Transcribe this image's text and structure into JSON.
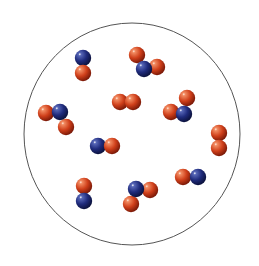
{
  "diagram": {
    "type": "particle-container",
    "container": {
      "cx": 132,
      "cy": 134,
      "rx": 108,
      "ry": 111,
      "stroke": "#555555"
    },
    "atom_radius": 8.2,
    "colors": {
      "nitrogen": {
        "base": "#1f2b7c",
        "light": "#5868b8",
        "dark": "#0a1038"
      },
      "oxygen": {
        "base": "#cf3f1a",
        "light": "#f28c62",
        "dark": "#741606"
      }
    },
    "molecules": [
      {
        "formula": "NO",
        "atoms": [
          {
            "el": "nitrogen",
            "x": 83,
            "y": 58
          },
          {
            "el": "oxygen",
            "x": 83,
            "y": 73
          }
        ]
      },
      {
        "formula": "NO2",
        "atoms": [
          {
            "el": "oxygen",
            "x": 137,
            "y": 55
          },
          {
            "el": "oxygen",
            "x": 157,
            "y": 67
          },
          {
            "el": "nitrogen",
            "x": 144,
            "y": 69
          }
        ]
      },
      {
        "formula": "O2",
        "atoms": [
          {
            "el": "oxygen",
            "x": 120,
            "y": 102
          },
          {
            "el": "oxygen",
            "x": 133,
            "y": 102
          }
        ]
      },
      {
        "formula": "NO2",
        "atoms": [
          {
            "el": "oxygen",
            "x": 187,
            "y": 98
          },
          {
            "el": "oxygen",
            "x": 171,
            "y": 112
          },
          {
            "el": "nitrogen",
            "x": 184,
            "y": 114
          }
        ]
      },
      {
        "formula": "NO2",
        "atoms": [
          {
            "el": "oxygen",
            "x": 46,
            "y": 113
          },
          {
            "el": "oxygen",
            "x": 66,
            "y": 127
          },
          {
            "el": "nitrogen",
            "x": 60,
            "y": 112
          }
        ]
      },
      {
        "formula": "O2",
        "atoms": [
          {
            "el": "oxygen",
            "x": 219,
            "y": 133
          },
          {
            "el": "oxygen",
            "x": 219,
            "y": 148
          }
        ]
      },
      {
        "formula": "NO",
        "atoms": [
          {
            "el": "nitrogen",
            "x": 98,
            "y": 146
          },
          {
            "el": "oxygen",
            "x": 112,
            "y": 146
          }
        ]
      },
      {
        "formula": "NO",
        "atoms": [
          {
            "el": "oxygen",
            "x": 183,
            "y": 177
          },
          {
            "el": "nitrogen",
            "x": 198,
            "y": 177
          }
        ]
      },
      {
        "formula": "NO",
        "atoms": [
          {
            "el": "oxygen",
            "x": 84,
            "y": 186
          },
          {
            "el": "nitrogen",
            "x": 84,
            "y": 201
          }
        ]
      },
      {
        "formula": "NO2",
        "atoms": [
          {
            "el": "oxygen",
            "x": 150,
            "y": 190
          },
          {
            "el": "oxygen",
            "x": 131,
            "y": 204
          },
          {
            "el": "nitrogen",
            "x": 136,
            "y": 189
          }
        ]
      }
    ]
  }
}
